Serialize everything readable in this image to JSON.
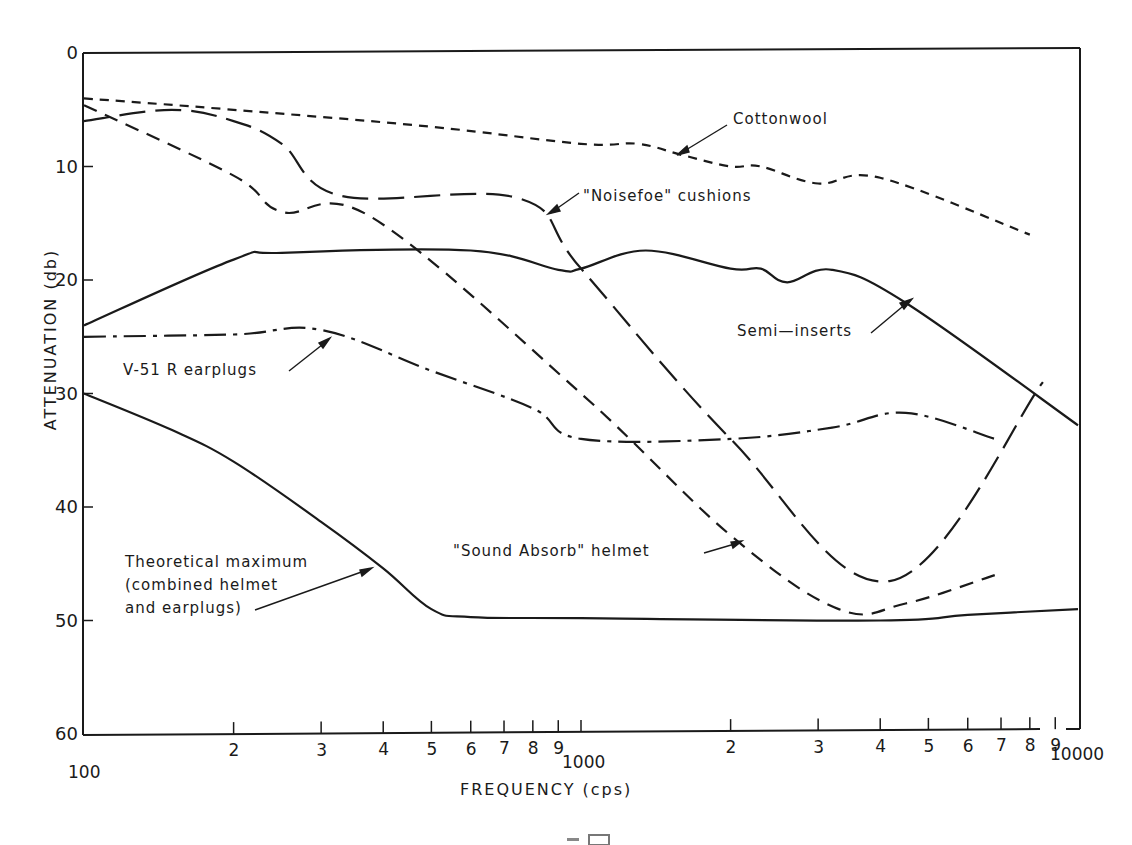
{
  "chart_data": {
    "type": "line",
    "title": "",
    "xlabel": "FREQUENCY (cps)",
    "ylabel": "ATTENUATION (db)",
    "xscale": "log",
    "xlim": [
      100,
      10000
    ],
    "ylim": [
      0,
      60
    ],
    "y_inverted": true,
    "grid": false,
    "y_ticks": [
      0,
      10,
      20,
      30,
      40,
      50,
      60
    ],
    "x_tick_labels": {
      "decade_100": [
        "100",
        "2",
        "3",
        "4",
        "5",
        "6",
        "7",
        "8",
        "9"
      ],
      "decade_1000": [
        "1000",
        "2",
        "3",
        "4",
        "5",
        "6",
        "7",
        "8",
        "9"
      ],
      "end": "10000"
    },
    "series": [
      {
        "name": "Cottonwool",
        "style": "short-dash",
        "x": [
          100,
          200,
          500,
          1000,
          1300,
          1600,
          2000,
          2300,
          3000,
          4000,
          8000
        ],
        "values": [
          4,
          5,
          6.5,
          8,
          8,
          9,
          10,
          10,
          11.5,
          11,
          16
        ]
      },
      {
        "name": "\"Noisefoe\" cushions",
        "style": "long-dash",
        "x": [
          100,
          150,
          200,
          250,
          330,
          750,
          1000,
          2000,
          4200,
          8500
        ],
        "values": [
          6,
          5,
          6,
          8,
          12.6,
          12.8,
          19,
          34,
          46.5,
          29
        ]
      },
      {
        "name": "\"Sound Absorb\" helmet",
        "style": "medium-dash",
        "x": [
          100,
          200,
          250,
          380,
          1000,
          2000,
          3300,
          4500,
          6800
        ],
        "values": [
          4.6,
          10.8,
          14,
          14.5,
          30,
          42.5,
          49,
          48.5,
          46
        ]
      },
      {
        "name": "Semi-inserts",
        "style": "solid",
        "x": [
          100,
          200,
          250,
          600,
          900,
          1000,
          1350,
          2000,
          2300,
          2600,
          3200,
          4500,
          10000
        ],
        "values": [
          24,
          18.2,
          17.6,
          17.4,
          19.1,
          19,
          17.4,
          19,
          19,
          20.2,
          19.1,
          22,
          32.8
        ]
      },
      {
        "name": "V-51R earplugs",
        "style": "dash-dot",
        "x": [
          100,
          200,
          300,
          500,
          800,
          1000,
          2000,
          3200,
          4500,
          6800
        ],
        "values": [
          25,
          24.8,
          24.4,
          28,
          31.3,
          34,
          34,
          33,
          31.7,
          34
        ]
      },
      {
        "name": "Theoretical maximum (combined helmet and earplugs)",
        "style": "solid",
        "x": [
          100,
          150,
          200,
          300,
          400,
          500,
          600,
          1000,
          4000,
          6000,
          10000
        ],
        "values": [
          30,
          33.2,
          36,
          41.3,
          45.4,
          49,
          49.7,
          49.8,
          50,
          49.5,
          49
        ]
      }
    ],
    "annotations": [
      {
        "text": "Cottonwool"
      },
      {
        "text": "\"Noisefoe\" cushions"
      },
      {
        "text": "Semi-inserts"
      },
      {
        "text": "V-51 R earplugs"
      },
      {
        "text": "\"Sound Absorb\" helmet"
      },
      {
        "text": "Theoretical maximum (combined helmet and earplugs)"
      }
    ]
  },
  "labels": {
    "cottonwool": "Cottonwool",
    "noisefoe": "\"Noisefoe\" cushions",
    "semi_inserts": "Semi—inserts",
    "v51r": "V-51 R  earplugs",
    "sound_absorb": "\"Sound  Absorb\"  helmet",
    "theoretical_1": "Theoretical  maximum",
    "theoretical_2": "(combined  helmet",
    "theoretical_3": "and  earplugs)"
  },
  "axes": {
    "x_title": "FREQUENCY  (cps)",
    "y_title": "ATTENUATION  (db)",
    "y_ticks": [
      "0",
      "10",
      "20",
      "30",
      "40",
      "50",
      "60"
    ],
    "x_ticks_d1": [
      "2",
      "3",
      "4",
      "5",
      "6",
      "7",
      "8",
      "9"
    ],
    "x_ticks_d2": [
      "2",
      "3",
      "4",
      "5",
      "6",
      "7",
      "8",
      "9"
    ],
    "x_start": "100",
    "x_mid": "1000",
    "x_end": "10000"
  }
}
